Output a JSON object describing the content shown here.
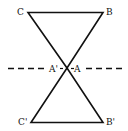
{
  "diagram": {
    "labels": {
      "C": "C",
      "B": "B",
      "A_prime": "A'",
      "A": "A",
      "C_prime": "C'",
      "B_prime": "B'"
    },
    "colors": {
      "stroke": "#111111",
      "background": "#ffffff"
    }
  }
}
